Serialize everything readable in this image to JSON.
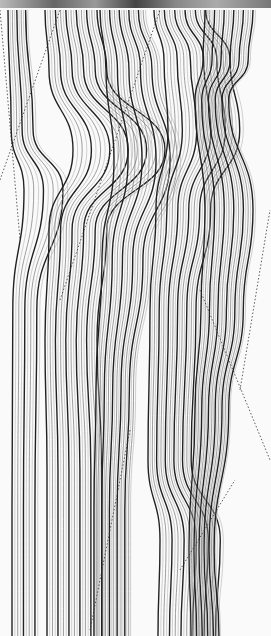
{
  "artwork": {
    "type": "abstract generative line art",
    "colors": {
      "background": "#fafafa",
      "line_dark": "#222222",
      "line_mid": "#777777",
      "line_light": "#bbbbbb"
    },
    "bands": [
      {
        "x": 8,
        "count": 10,
        "spacing": 2.2,
        "wave": [
          [
            0,
            0
          ],
          [
            120,
            8
          ],
          [
            180,
            40
          ],
          [
            300,
            12
          ],
          [
            500,
            10
          ],
          [
            626,
            10
          ]
        ]
      },
      {
        "x": 45,
        "count": 22,
        "spacing": 2.6,
        "wave": [
          [
            0,
            0
          ],
          [
            60,
            10
          ],
          [
            140,
            70
          ],
          [
            220,
            10
          ],
          [
            330,
            0
          ],
          [
            460,
            5
          ],
          [
            626,
            5
          ]
        ]
      },
      {
        "x": 100,
        "count": 20,
        "spacing": 2.4,
        "wave": [
          [
            0,
            0
          ],
          [
            60,
            15
          ],
          [
            150,
            35
          ],
          [
            250,
            5
          ],
          [
            380,
            -10
          ],
          [
            500,
            -15
          ],
          [
            626,
            -15
          ]
        ]
      },
      {
        "x": 150,
        "count": 22,
        "spacing": 2.3,
        "wave": [
          [
            0,
            10
          ],
          [
            50,
            35
          ],
          [
            120,
            45
          ],
          [
            200,
            15
          ],
          [
            300,
            0
          ],
          [
            450,
            -5
          ],
          [
            530,
            25
          ],
          [
            626,
            20
          ]
        ]
      },
      {
        "x": 205,
        "count": 22,
        "spacing": 2.4,
        "wave": [
          [
            0,
            0
          ],
          [
            50,
            -5
          ],
          [
            90,
            -25
          ],
          [
            200,
            0
          ],
          [
            300,
            -10
          ],
          [
            400,
            -25
          ],
          [
            540,
            -40
          ],
          [
            626,
            -35
          ]
        ]
      }
    ]
  }
}
